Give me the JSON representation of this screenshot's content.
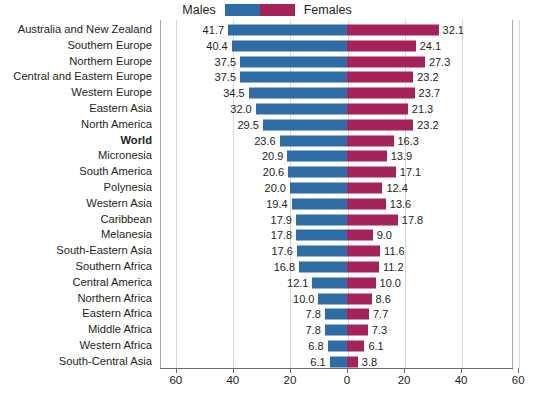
{
  "chart_data": {
    "type": "bar",
    "subtype": "diverging-horizontal-bar",
    "title": "",
    "xlabel": "",
    "ylabel": "",
    "xlim": [
      -60,
      60
    ],
    "x_ticks": [
      "60",
      "40",
      "20",
      "0",
      "20",
      "40",
      "60"
    ],
    "x_tick_values": [
      60,
      40,
      20,
      0,
      20,
      40,
      60
    ],
    "grid": true,
    "legend_position": "top-center",
    "colors": {
      "males": "#2d6ca5",
      "females": "#a4235a",
      "text": "#231f20",
      "gridline": "#d9d9d9",
      "axis": "#6d6e71",
      "background": "#ffffff"
    },
    "legend": [
      {
        "name": "legend-males",
        "label": "Males",
        "color": "#2d6ca5",
        "side": "left"
      },
      {
        "name": "legend-females",
        "label": "Females",
        "color": "#a4235a",
        "side": "right"
      }
    ],
    "categories": [
      "Australia and New Zealand",
      "Southern Europe",
      "Northern Europe",
      "Central and Eastern Europe",
      "Western Europe",
      "Eastern Asia",
      "North America",
      "World",
      "Micronesia",
      "South America",
      "Polynesia",
      "Western Asia",
      "Caribbean",
      "Melanesia",
      "South-Eastern Asia",
      "Southern Africa",
      "Central America",
      "Northern Africa",
      "Eastern Africa",
      "Middle Africa",
      "Western Africa",
      "South-Central Asia"
    ],
    "emphasized_categories": [
      "World"
    ],
    "series": [
      {
        "name": "Males",
        "color": "#2d6ca5",
        "direction": "left",
        "values": [
          41.7,
          40.4,
          37.5,
          37.5,
          34.5,
          32.0,
          29.5,
          23.6,
          20.9,
          20.6,
          20.0,
          19.4,
          17.9,
          17.8,
          17.6,
          16.8,
          12.1,
          10.0,
          7.8,
          7.8,
          6.8,
          6.1
        ],
        "labels": [
          "41.7",
          "40.4",
          "37.5",
          "37.5",
          "34.5",
          "32.0",
          "29.5",
          "23.6",
          "20.9",
          "20.6",
          "20.0",
          "19.4",
          "17.9",
          "17.8",
          "17.6",
          "16.8",
          "12.1",
          "10.0",
          "7.8",
          "7.8",
          "6.8",
          "6.1"
        ]
      },
      {
        "name": "Females",
        "color": "#a4235a",
        "direction": "right",
        "values": [
          32.1,
          24.1,
          27.3,
          23.2,
          23.7,
          21.3,
          23.2,
          16.3,
          13.9,
          17.1,
          12.4,
          13.6,
          17.8,
          9.0,
          11.6,
          11.2,
          10.0,
          8.6,
          7.7,
          7.3,
          6.1,
          3.8
        ],
        "labels": [
          "32.1",
          "24.1",
          "27.3",
          "23.2",
          "23.7",
          "21.3",
          "23.2",
          "16.3",
          "13.9",
          "17.1",
          "12.4",
          "13.6",
          "17.8",
          "9.0",
          "11.6",
          "11.2",
          "10.0",
          "8.6",
          "7.7",
          "7.3",
          "6.1",
          "3.8"
        ]
      }
    ]
  }
}
